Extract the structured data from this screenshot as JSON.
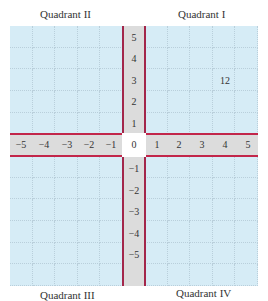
{
  "quadrants": {
    "q1": "Quadrant I",
    "q2": "Quadrant II",
    "q3": "Quadrant III",
    "q4": "Quadrant IV"
  },
  "x_axis": [
    "−5",
    "−4",
    "−3",
    "−2",
    "−1",
    "0",
    "1",
    "2",
    "3",
    "4",
    "5"
  ],
  "y_axis_pos": [
    "5",
    "4",
    "3",
    "2",
    "1"
  ],
  "y_axis_neg": [
    "−1",
    "−2",
    "−3",
    "−4",
    "−5"
  ],
  "annotation": {
    "text": "12",
    "x": 4,
    "y": 3
  },
  "colors": {
    "grid_bg": "#d6ecf6",
    "axis_band": "#dcdcdc",
    "axis_line": "#a3264a"
  }
}
